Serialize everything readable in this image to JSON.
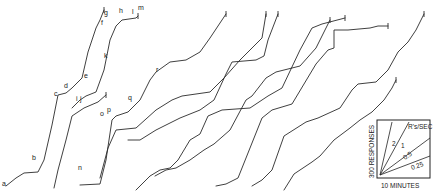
{
  "chart_data": {
    "type": "line",
    "title": "",
    "xlabel": "",
    "ylabel": "",
    "grid": false,
    "markers": [
      "a",
      "b",
      "c",
      "d",
      "e",
      "f",
      "g",
      "h",
      "i",
      "j",
      "k",
      "l",
      "m",
      "n",
      "o",
      "p",
      "q",
      "r"
    ],
    "series": [
      {
        "name": "record-1",
        "points": [
          [
            6,
            186
          ],
          [
            16,
            178
          ],
          [
            24,
            173
          ],
          [
            38,
            172
          ],
          [
            44,
            160
          ],
          [
            52,
            125
          ],
          [
            58,
            95
          ],
          [
            66,
            93
          ],
          [
            72,
            88
          ],
          [
            82,
            78
          ],
          [
            88,
            52
          ],
          [
            96,
            28
          ],
          [
            100,
            20
          ],
          [
            104,
            10
          ]
        ]
      },
      {
        "name": "record-2",
        "points": [
          [
            72,
            108
          ],
          [
            80,
            100
          ],
          [
            86,
            96
          ],
          [
            96,
            92
          ],
          [
            104,
            70
          ],
          [
            110,
            40
          ],
          [
            116,
            26
          ],
          [
            122,
            20
          ],
          [
            136,
            18
          ],
          [
            138,
            16
          ]
        ]
      },
      {
        "name": "record-3",
        "points": [
          [
            54,
            188
          ],
          [
            58,
            170
          ],
          [
            66,
            140
          ],
          [
            72,
            116
          ],
          [
            84,
            108
          ],
          [
            98,
            102
          ],
          [
            106,
            95
          ]
        ]
      },
      {
        "name": "record-4",
        "points": [
          [
            80,
            185
          ],
          [
            100,
            184
          ],
          [
            106,
            160
          ],
          [
            112,
            120
          ],
          [
            116,
            116
          ],
          [
            128,
            112
          ],
          [
            140,
            100
          ],
          [
            150,
            80
          ],
          [
            156,
            72
          ],
          [
            170,
            62
          ],
          [
            186,
            60
          ],
          [
            200,
            52
          ],
          [
            210,
            38
          ],
          [
            226,
            14
          ]
        ]
      },
      {
        "name": "record-5",
        "points": [
          [
            100,
            178
          ],
          [
            108,
            148
          ],
          [
            116,
            130
          ],
          [
            136,
            128
          ],
          [
            156,
            110
          ],
          [
            172,
            100
          ],
          [
            182,
            96
          ],
          [
            210,
            92
          ],
          [
            224,
            78
          ],
          [
            240,
            60
          ],
          [
            254,
            46
          ],
          [
            262,
            38
          ],
          [
            266,
            14
          ]
        ]
      },
      {
        "name": "record-6",
        "points": [
          [
            128,
            140
          ],
          [
            140,
            140
          ],
          [
            156,
            130
          ],
          [
            168,
            124
          ],
          [
            180,
            118
          ],
          [
            200,
            110
          ],
          [
            214,
            100
          ],
          [
            226,
            74
          ],
          [
            232,
            62
          ],
          [
            256,
            60
          ],
          [
            264,
            56
          ],
          [
            268,
            40
          ],
          [
            278,
            14
          ]
        ]
      },
      {
        "name": "record-7",
        "points": [
          [
            136,
            190
          ],
          [
            150,
            176
          ],
          [
            160,
            170
          ],
          [
            170,
            168
          ],
          [
            178,
            160
          ],
          [
            190,
            140
          ],
          [
            200,
            134
          ],
          [
            208,
            116
          ],
          [
            222,
            110
          ],
          [
            250,
            108
          ],
          [
            268,
            96
          ],
          [
            282,
            88
          ],
          [
            300,
            50
          ],
          [
            312,
            28
          ],
          [
            322,
            24
          ],
          [
            345,
            18
          ]
        ]
      },
      {
        "name": "record-8",
        "points": [
          [
            155,
            176
          ],
          [
            166,
            170
          ],
          [
            176,
            168
          ],
          [
            190,
            160
          ],
          [
            204,
            150
          ],
          [
            214,
            144
          ],
          [
            230,
            130
          ],
          [
            246,
            100
          ],
          [
            252,
            96
          ],
          [
            266,
            78
          ],
          [
            276,
            72
          ],
          [
            300,
            66
          ],
          [
            316,
            48
          ],
          [
            330,
            20
          ]
        ]
      },
      {
        "name": "record-9",
        "points": [
          [
            216,
            186
          ],
          [
            226,
            184
          ],
          [
            238,
            178
          ],
          [
            246,
            158
          ],
          [
            262,
            118
          ],
          [
            272,
            110
          ],
          [
            292,
            104
          ],
          [
            316,
            64
          ],
          [
            328,
            50
          ],
          [
            334,
            48
          ],
          [
            334,
            30
          ],
          [
            348,
            30
          ],
          [
            370,
            28
          ],
          [
            378,
            26
          ],
          [
            388,
            26
          ]
        ]
      },
      {
        "name": "record-10",
        "points": [
          [
            252,
            186
          ],
          [
            262,
            180
          ],
          [
            272,
            170
          ],
          [
            284,
            136
          ],
          [
            306,
            122
          ],
          [
            318,
            118
          ],
          [
            340,
            108
          ],
          [
            352,
            90
          ],
          [
            358,
            84
          ],
          [
            376,
            82
          ],
          [
            388,
            70
          ],
          [
            398,
            52
          ],
          [
            408,
            42
          ],
          [
            416,
            30
          ],
          [
            424,
            14
          ]
        ]
      },
      {
        "name": "record-11",
        "points": [
          [
            284,
            190
          ],
          [
            294,
            174
          ],
          [
            312,
            162
          ],
          [
            320,
            156
          ],
          [
            334,
            140
          ],
          [
            350,
            128
          ],
          [
            360,
            120
          ],
          [
            372,
            112
          ],
          [
            384,
            100
          ],
          [
            392,
            88
          ],
          [
            396,
            80
          ]
        ]
      }
    ],
    "legend_inset": {
      "title": "R's/SEC",
      "xlabel": "10 MINUTES",
      "ylabel": "300 RESPONSES",
      "slopes": [
        "2",
        "1",
        "0.5",
        "0.25"
      ]
    }
  },
  "labels": {
    "a": {
      "text": "a",
      "x": 2,
      "y": 186
    },
    "b": {
      "text": "b",
      "x": 32,
      "y": 160
    },
    "c": {
      "text": "c",
      "x": 54,
      "y": 96
    },
    "d": {
      "text": "d",
      "x": 64,
      "y": 88
    },
    "e": {
      "text": "e",
      "x": 84,
      "y": 78
    },
    "f": {
      "text": "f",
      "x": 101,
      "y": 25
    },
    "g": {
      "text": "g",
      "x": 104,
      "y": 15
    },
    "h": {
      "text": "h",
      "x": 119,
      "y": 13
    },
    "i": {
      "text": "i",
      "x": 76,
      "y": 101
    },
    "j": {
      "text": "j",
      "x": 80,
      "y": 101
    },
    "k": {
      "text": "k",
      "x": 104,
      "y": 58
    },
    "l": {
      "text": "l",
      "x": 132,
      "y": 14
    },
    "m": {
      "text": "m",
      "x": 138,
      "y": 10
    },
    "n": {
      "text": "n",
      "x": 78,
      "y": 170
    },
    "o": {
      "text": "o",
      "x": 100,
      "y": 116
    },
    "p": {
      "text": "p",
      "x": 107,
      "y": 112
    },
    "q": {
      "text": "q",
      "x": 128,
      "y": 100
    },
    "r": {
      "text": "r",
      "x": 156,
      "y": 72
    }
  }
}
